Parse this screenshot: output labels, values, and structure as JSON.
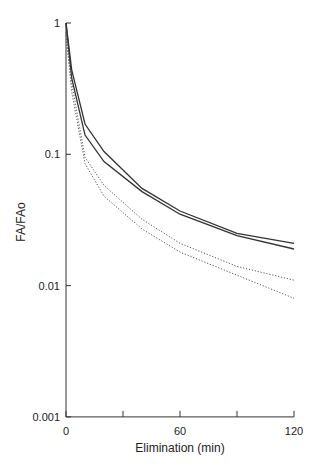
{
  "chart_data": {
    "type": "line",
    "title": "",
    "xlabel": "Elimination (min)",
    "ylabel": "FA/FAo",
    "yscale": "log",
    "xlim": [
      0,
      120
    ],
    "ylim": [
      0.001,
      1
    ],
    "xticks": [
      0,
      30,
      60,
      90,
      120
    ],
    "xtick_labels": [
      "0",
      "",
      "60",
      "",
      "120"
    ],
    "yticks": [
      1,
      0.1,
      0.01,
      0.001
    ],
    "ytick_labels": [
      "1",
      "0.1",
      "0.01",
      "0.001"
    ],
    "grid": false,
    "legend": null,
    "x": [
      0,
      3,
      10,
      20,
      40,
      60,
      90,
      120
    ],
    "series": [
      {
        "name": "solid-upper",
        "style": "solid",
        "values": [
          1,
          0.44,
          0.17,
          0.105,
          0.055,
          0.037,
          0.025,
          0.021
        ]
      },
      {
        "name": "solid-lower",
        "style": "solid",
        "values": [
          1,
          0.38,
          0.14,
          0.088,
          0.052,
          0.035,
          0.024,
          0.019
        ]
      },
      {
        "name": "dotted-upper",
        "style": "dotted",
        "values": [
          0.85,
          0.35,
          0.095,
          0.058,
          0.032,
          0.021,
          0.014,
          0.011
        ]
      },
      {
        "name": "dotted-lower",
        "style": "dotted",
        "values": [
          0.8,
          0.3,
          0.085,
          0.048,
          0.027,
          0.018,
          0.012,
          0.008
        ]
      }
    ]
  }
}
